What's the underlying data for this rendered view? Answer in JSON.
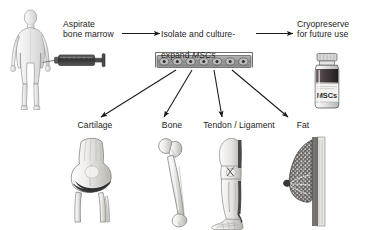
{
  "figure": {
    "background_color": "#ffffff",
    "ink_color": "#1c1c1c",
    "width": 374,
    "height": 230
  },
  "steps": {
    "aspirate": {
      "label": "Aspirate\nbone marrow",
      "icon": "human-body-icon",
      "tool_icon": "syringe-icon"
    },
    "expand": {
      "label_line1": "Isolate and culture-",
      "label_line2_prefix": "expand ",
      "label_line2_italic": "MSCs",
      "icon": "cell-culture-plate-icon",
      "well_count": 7
    },
    "cryopreserve": {
      "label": "Cryopreserve\nfor future use",
      "icon": "cryovial-icon",
      "vial_label": "MSCs"
    }
  },
  "arrows": {
    "aspirate_to_expand": "arrow-right-icon",
    "expand_to_cryopreserve": "arrow-right-icon",
    "differentiation": [
      "arrow-down-left-icon",
      "arrow-down-left-icon",
      "arrow-down-icon",
      "arrow-down-right-icon"
    ]
  },
  "lineages": [
    {
      "label": "Cartilage",
      "icon": "knee-joint-icon"
    },
    {
      "label": "Bone",
      "icon": "femur-bone-icon"
    },
    {
      "label": "Tendon / Ligament",
      "icon": "leg-tendon-icon"
    },
    {
      "label": "Fat",
      "icon": "breast-adipose-icon"
    }
  ],
  "colors": {
    "ink": "#1c1c1c",
    "line": "#4a4a4a",
    "tissue_light": "#f2f2f2",
    "tissue_mid": "#c9c9c9",
    "tissue_dark": "#6e6e6e",
    "cartilage_dark": "#3a3a3a",
    "syringe_barrel": "#3d3d3d",
    "vial_fluid": "#4a4042"
  }
}
